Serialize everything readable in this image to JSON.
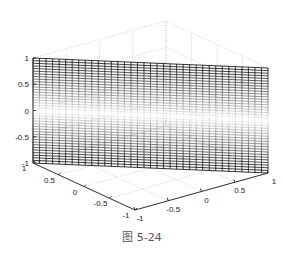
{
  "chart_data": {
    "type": "surface3d",
    "title": "",
    "caption": "图 5-24",
    "xlabel": "",
    "ylabel": "",
    "zlabel": "",
    "xlim": [
      -1,
      1
    ],
    "ylim": [
      -1,
      1
    ],
    "zlim": [
      -1,
      1
    ],
    "x_ticks": [
      "-1",
      "-0.5",
      "0",
      "0.5",
      "1"
    ],
    "y_ticks": [
      "-1",
      "-0.5",
      "0",
      "0.5",
      "1"
    ],
    "z_ticks": [
      "-1",
      "-0.5",
      "0",
      "0.5",
      "1"
    ],
    "grid": true,
    "mesh_columns": 36,
    "mesh_rows": 40,
    "colormap": "gray, dark at |z|=1 fading to white at z=0"
  },
  "caption": "图 5-24"
}
